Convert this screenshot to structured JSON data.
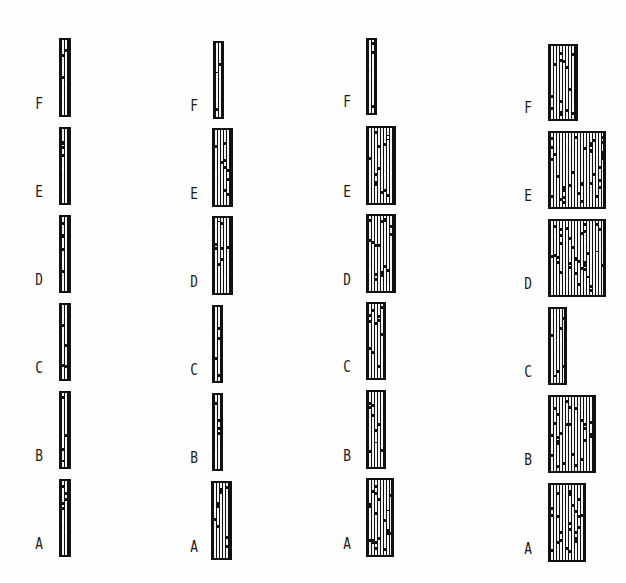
{
  "figure": {
    "columns": [
      {
        "id": "col1",
        "label_x": 33,
        "groups": [
          {
            "label": "F",
            "x": 59,
            "y": 38,
            "w": 12,
            "h": 79
          },
          {
            "label": "E",
            "x": 59,
            "y": 127,
            "w": 12,
            "h": 78
          },
          {
            "label": "D",
            "x": 59,
            "y": 215,
            "w": 12,
            "h": 78
          },
          {
            "label": "C",
            "x": 59,
            "y": 303,
            "w": 12,
            "h": 78
          },
          {
            "label": "B",
            "x": 59,
            "y": 391,
            "w": 12,
            "h": 78
          },
          {
            "label": "A",
            "x": 59,
            "y": 479,
            "w": 12,
            "h": 78
          }
        ]
      },
      {
        "id": "col2",
        "label_x": 188,
        "groups": [
          {
            "label": "F",
            "x": 213,
            "y": 41,
            "w": 11,
            "h": 78
          },
          {
            "label": "E",
            "x": 212,
            "y": 128,
            "w": 21,
            "h": 79
          },
          {
            "label": "D",
            "x": 212,
            "y": 216,
            "w": 21,
            "h": 79
          },
          {
            "label": "C",
            "x": 212,
            "y": 305,
            "w": 11,
            "h": 78
          },
          {
            "label": "B",
            "x": 212,
            "y": 393,
            "w": 11,
            "h": 78
          },
          {
            "label": "A",
            "x": 211,
            "y": 481,
            "w": 21,
            "h": 79
          }
        ]
      },
      {
        "id": "col3",
        "label_x": 341,
        "groups": [
          {
            "label": "F",
            "x": 366,
            "y": 38,
            "w": 11,
            "h": 77
          },
          {
            "label": "E",
            "x": 366,
            "y": 126,
            "w": 30,
            "h": 79
          },
          {
            "label": "D",
            "x": 366,
            "y": 214,
            "w": 30,
            "h": 79
          },
          {
            "label": "C",
            "x": 366,
            "y": 302,
            "w": 20,
            "h": 78
          },
          {
            "label": "B",
            "x": 366,
            "y": 390,
            "w": 20,
            "h": 79
          },
          {
            "label": "A",
            "x": 366,
            "y": 478,
            "w": 28,
            "h": 79
          }
        ]
      },
      {
        "id": "col4",
        "label_x": 522,
        "groups": [
          {
            "label": "F",
            "x": 548,
            "y": 44,
            "w": 30,
            "h": 77
          },
          {
            "label": "E",
            "x": 548,
            "y": 131,
            "w": 58,
            "h": 78
          },
          {
            "label": "D",
            "x": 548,
            "y": 219,
            "w": 58,
            "h": 78
          },
          {
            "label": "C",
            "x": 548,
            "y": 307,
            "w": 19,
            "h": 78
          },
          {
            "label": "B",
            "x": 548,
            "y": 395,
            "w": 48,
            "h": 78
          },
          {
            "label": "A",
            "x": 548,
            "y": 483,
            "w": 38,
            "h": 79
          }
        ]
      }
    ],
    "colors": {
      "frame": "#111111",
      "stripe_light": "#f4f4f4",
      "background": "#fefefe",
      "label": "#1a1a1a"
    }
  }
}
